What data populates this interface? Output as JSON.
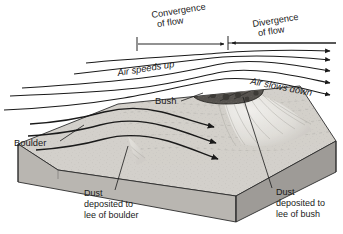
{
  "figure": {
    "type": "block-diagram",
    "width": 343,
    "height": 234,
    "background_color": "#ffffff"
  },
  "labels": {
    "convergence": {
      "line1": "Convergence",
      "line2": "of flow"
    },
    "divergence": {
      "line1": "Divergence",
      "line2": "of flow"
    },
    "air_speeds_up": "Air speeds up",
    "air_slows_down": "Air slows down",
    "bush": "Bush",
    "boulder": "Boulder",
    "dust_boulder": {
      "line1": "Dust",
      "line2": "deposited to",
      "line3": "lee of boulder"
    },
    "dust_bush": {
      "line1": "Dust",
      "line2": "deposited to",
      "line3": "lee of bush"
    }
  },
  "colors": {
    "ink": "#1a1a1a",
    "block_top": "#d3d0cb",
    "block_front_left": "#b9b6b1",
    "block_front_right": "#9e9b97",
    "boulder_dark": "#5a5754",
    "bush_dark": "#57544f",
    "dust_light": "#e6e4e0",
    "outline": "#2b2b2b",
    "paper": "#ffffff"
  },
  "elements": {
    "measure_bar": {
      "name": "convergence-divergence-measure",
      "left_tick_x": 137,
      "mid_tick_x": 228,
      "right_end_x": 336,
      "y": 44
    },
    "airflow_streamlines_upper": {
      "count": 4,
      "direction": "left-to-right",
      "arrowheads": "right"
    },
    "airflow_streamlines_surface": {
      "count": 3,
      "direction": "left-to-right",
      "arrowheads": "right"
    }
  }
}
